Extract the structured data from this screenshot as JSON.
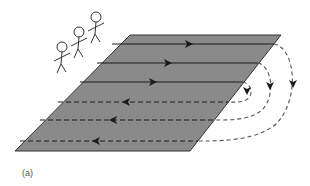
{
  "figure": {
    "caption": "(a)",
    "colors": {
      "field_fill": "#8a8a8a",
      "field_edge": "#333333",
      "line": "#1a1a1a",
      "dash_outside": "#555555",
      "figure_stroke": "#333333",
      "background": "#ffffff"
    },
    "field": {
      "points": [
        [
          130,
          35
        ],
        [
          281,
          35
        ],
        [
          190,
          151
        ],
        [
          15,
          151
        ]
      ]
    },
    "people": [
      {
        "head": [
          96,
          17
        ],
        "r": 5
      },
      {
        "head": [
          79,
          32
        ],
        "r": 5
      },
      {
        "head": [
          62,
          47
        ],
        "r": 5
      }
    ],
    "outbound_lines": [
      {
        "y": 44,
        "x1": 112,
        "x2": 274,
        "arrow_x": 189,
        "direction": "right"
      },
      {
        "y": 63,
        "x1": 97,
        "x2": 258,
        "arrow_x": 168,
        "direction": "right"
      },
      {
        "y": 82,
        "x1": 80,
        "x2": 243,
        "arrow_x": 153,
        "direction": "right"
      }
    ],
    "return_lines": [
      {
        "y": 102,
        "x1": 58,
        "x2": 228,
        "arrow_x": 126,
        "direction": "left"
      },
      {
        "y": 120,
        "x1": 40,
        "x2": 215,
        "arrow_x": 113,
        "direction": "left"
      },
      {
        "y": 141,
        "x1": 20,
        "x2": 198,
        "arrow_x": 96,
        "direction": "left"
      }
    ],
    "turn_arrows": [
      {
        "x": 247,
        "y": 91,
        "direction": "down"
      },
      {
        "x": 270,
        "y": 86,
        "direction": "down"
      },
      {
        "x": 293,
        "y": 84,
        "direction": "down"
      }
    ]
  }
}
